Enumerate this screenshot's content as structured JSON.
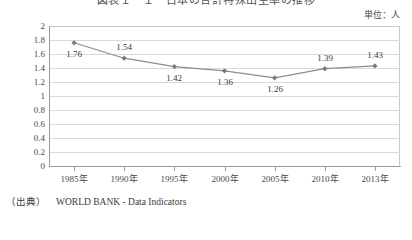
{
  "chart_title": "図表１－１　日本の合計特殊出生率の推移",
  "unit_label": "単位：人",
  "source": {
    "prefix": "（出典）",
    "text": "WORLD BANK - Data Indicators"
  },
  "colors": {
    "line": "#8c8c8c",
    "marker": "#7a7a7a",
    "gridline": "#d9d9d9",
    "axis": "#9a9a9a",
    "text": "#3a3a3a"
  },
  "chart_data": {
    "type": "line",
    "title": "図表１－１　日本の合計特殊出生率の推移",
    "xlabel": "",
    "ylabel": "",
    "unit": "単位：人",
    "categories": [
      "1985年",
      "1990年",
      "1995年",
      "2000年",
      "2005年",
      "2010年",
      "2013年"
    ],
    "values": [
      1.76,
      1.54,
      1.42,
      1.36,
      1.26,
      1.39,
      1.43
    ],
    "point_labels": [
      "1.76",
      "1.54",
      "1.42",
      "1.36",
      "1.26",
      "1.39",
      "1.43"
    ],
    "ylim": [
      0,
      2
    ],
    "yticks": [
      0,
      0.2,
      0.4,
      0.6,
      0.8,
      1,
      1.2,
      1.4,
      1.6,
      1.8,
      2
    ],
    "ytick_labels": [
      "0",
      "0.2",
      "0.4",
      "0.6",
      "0.8",
      "1",
      "1.2",
      "1.4",
      "1.6",
      "1.8",
      "2"
    ],
    "grid": true,
    "legend": false,
    "marker": "diamond",
    "label_offsets": [
      "below",
      "above",
      "below",
      "below",
      "below",
      "above",
      "above"
    ]
  }
}
